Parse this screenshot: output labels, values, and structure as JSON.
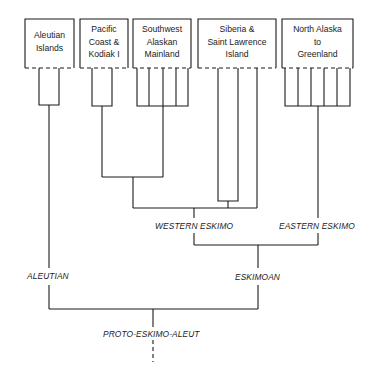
{
  "diagram": {
    "type": "language-family-tree",
    "line_color": "#1a1a1a",
    "background": "#ffffff",
    "regions": [
      {
        "id": "aleutian-islands",
        "label": "Aleutian\nIslands"
      },
      {
        "id": "pacific-coast-kodiak",
        "label": "Pacific\nCoast &\nKodiak I"
      },
      {
        "id": "southwest-alaskan-mainland",
        "label": "Southwest\nAlaskan\nMainland"
      },
      {
        "id": "siberia-saint-lawrence",
        "label": "Siberia &\nSaint Lawrence\nIsland"
      },
      {
        "id": "north-alaska-greenland",
        "label": "North Alaska\nto\nGreenland"
      }
    ],
    "branches": {
      "western_eskimo": "WESTERN ESKIMO",
      "eastern_eskimo": "EASTERN ESKIMO",
      "aleutian": "ALEUTIAN",
      "eskimoan": "ESKIMOAN",
      "root": "PROTO-ESKIMO-ALEUT"
    },
    "tree": {
      "name": "PROTO-ESKIMO-ALEUT",
      "children": [
        {
          "name": "ALEUTIAN",
          "children": [
            {
              "name": "Aleutian Islands",
              "dialects": 2
            }
          ]
        },
        {
          "name": "ESKIMOAN",
          "children": [
            {
              "name": "WESTERN ESKIMO",
              "children": [
                {
                  "name": "Pacific Coast & Kodiak I",
                  "dialects": 2
                },
                {
                  "name": "Southwest Alaskan Mainland",
                  "dialects": 5
                },
                {
                  "name": "Siberia & Saint Lawrence Island",
                  "dialects": 3
                }
              ]
            },
            {
              "name": "EASTERN ESKIMO",
              "children": [
                {
                  "name": "North Alaska to Greenland",
                  "dialects": 6
                }
              ]
            }
          ]
        }
      ]
    }
  }
}
